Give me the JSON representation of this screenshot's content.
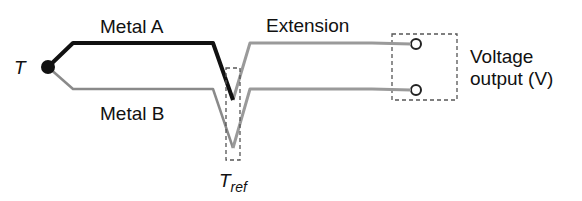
{
  "labels": {
    "hot_junction": "T",
    "metal_a": "Metal A",
    "metal_b": "Metal B",
    "extension": "Extension",
    "voltage_line1": "Voltage",
    "voltage_line2": "output (V)",
    "ref_junction_main": "T",
    "ref_junction_sub": "ref"
  },
  "colors": {
    "metal_a": "#111111",
    "metal_b": "#8a8a8a",
    "extension": "#9a9a9a",
    "dashed_box": "#555555",
    "terminal": "#222222"
  }
}
